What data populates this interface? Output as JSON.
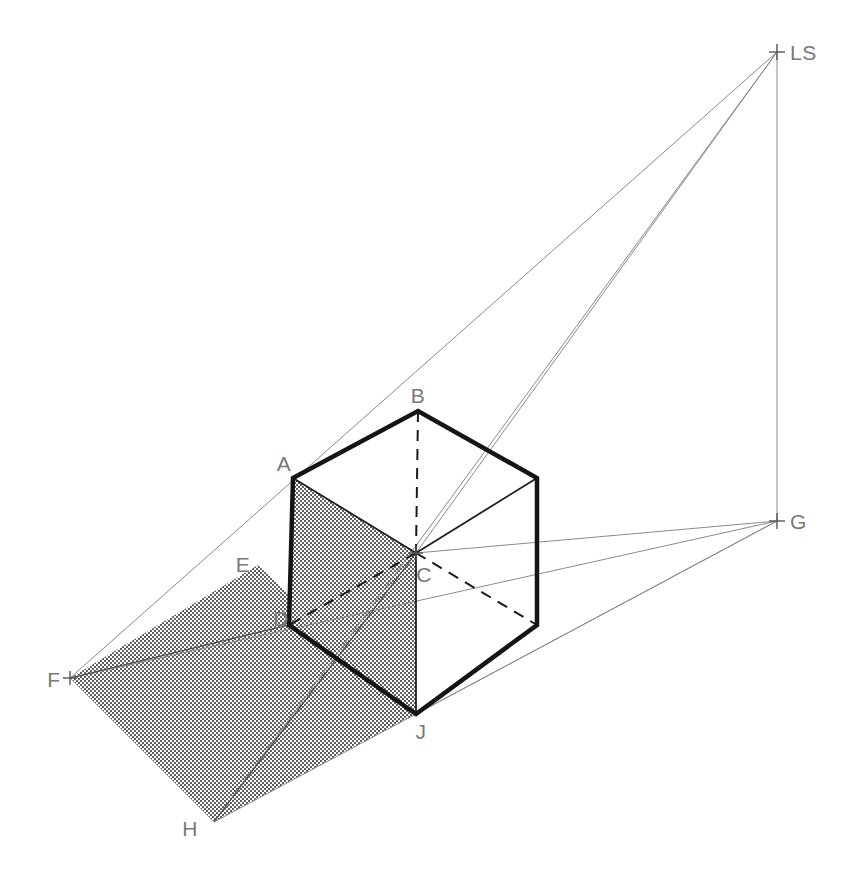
{
  "document": {
    "title": "Shadow Projection Construction",
    "type": "technical-line-drawing",
    "background_color": "#ffffff",
    "width": 856,
    "height": 888
  },
  "palette": {
    "solid_edge": "#1a1a1a",
    "thin_edge": "#333333",
    "ray_line": "#8a8a8a",
    "hidden_edge": "#1a1a1a",
    "label_text": "#77787b",
    "shadow_fill": "#c9c9c9",
    "shadow_dot": "#6e6e6e"
  },
  "labels": [
    {
      "id": "LS",
      "text": "LS",
      "x": 790,
      "y": 60,
      "anchor": "start"
    },
    {
      "id": "G",
      "text": "G",
      "x": 790,
      "y": 529,
      "anchor": "start"
    },
    {
      "id": "B",
      "text": "B",
      "x": 418,
      "y": 403,
      "anchor": "middle"
    },
    {
      "id": "A",
      "text": "A",
      "x": 284,
      "y": 471,
      "anchor": "middle"
    },
    {
      "id": "E",
      "text": "E",
      "x": 243,
      "y": 572,
      "anchor": "middle"
    },
    {
      "id": "C",
      "text": "C",
      "x": 424,
      "y": 582,
      "anchor": "middle"
    },
    {
      "id": "D",
      "text": "D",
      "x": 281,
      "y": 626,
      "anchor": "middle"
    },
    {
      "id": "F",
      "text": "F",
      "x": 54,
      "y": 687,
      "anchor": "middle"
    },
    {
      "id": "J",
      "text": "J",
      "x": 421,
      "y": 739,
      "anchor": "middle"
    },
    {
      "id": "H",
      "text": "H",
      "x": 190,
      "y": 836,
      "anchor": "middle"
    }
  ],
  "points": {
    "LS": {
      "x": 777,
      "y": 52,
      "marker": "cross"
    },
    "G": {
      "x": 777,
      "y": 521,
      "marker": "cross"
    },
    "A": {
      "x": 293,
      "y": 478,
      "marker": "none"
    },
    "B": {
      "x": 418,
      "y": 411,
      "marker": "none"
    },
    "C": {
      "x": 416,
      "y": 553,
      "marker": "cross"
    },
    "D": {
      "x": 289,
      "y": 625,
      "marker": "none"
    },
    "E": {
      "x": 258,
      "y": 565,
      "marker": "none"
    },
    "F": {
      "x": 70,
      "y": 678,
      "marker": "cross"
    },
    "H": {
      "x": 214,
      "y": 822,
      "marker": "none"
    },
    "J": {
      "x": 416,
      "y": 714,
      "marker": "none"
    },
    "TR": {
      "x": 537,
      "y": 478,
      "marker": "none"
    },
    "BR": {
      "x": 537,
      "y": 625,
      "marker": "none"
    },
    "JR": {
      "x": 537,
      "y": 625,
      "marker": "none"
    }
  },
  "geometry": {
    "cube_outline_bold": "M 293 478 L 418 411 L 537 478 L 537 625 L 416 714 L 289 625 Z",
    "cube_thin_edges": [
      {
        "name": "edge-A-C",
        "d": "M 293 478 L 416 553"
      },
      {
        "name": "edge-C-TR",
        "d": "M 416 553 L 537 478"
      },
      {
        "name": "edge-C-J",
        "d": "M 416 553 L 416 714"
      },
      {
        "name": "edge-J-BR",
        "d": "M 416 714 L 537 625"
      }
    ],
    "hidden_edges": [
      {
        "name": "hidden-B-C",
        "d": "M 418 411 L 416 553"
      },
      {
        "name": "hidden-C-D",
        "d": "M 416 553 L 289 625"
      },
      {
        "name": "hidden-C-BR",
        "d": "M 416 553 L 537 625"
      }
    ],
    "shadow_polygon": "M 258 565 L 70 678 L 214 822 L 416 714 Z",
    "shadow_face_left": "M 293 478 L 416 553 L 416 714 L 289 625 Z",
    "shadow_lines": [
      {
        "name": "shadow-line-F-D",
        "d": "M 70 678 L 289 625"
      },
      {
        "name": "shadow-line-D-J-back",
        "d": "M 289 625 L 416 714"
      },
      {
        "name": "shadow-line-H-C",
        "d": "M 214 822 L 416 553"
      }
    ],
    "light_rays": [
      {
        "name": "ray-LS-to-F-through-A",
        "d": "M 777 52 L 70 678"
      },
      {
        "name": "ray-LS-to-B-through-H",
        "d": "M 777 52 L 214 822"
      },
      {
        "name": "ray-LS-to-C",
        "d": "M 777 52 L 416 553"
      },
      {
        "name": "ray-LS-to-G-vertical",
        "d": "M 777 52 L 777 521"
      },
      {
        "name": "ray-G-to-E-through-F",
        "d": "M 777 521 L 70 678"
      },
      {
        "name": "ray-G-to-C",
        "d": "M 777 521 L 416 553"
      },
      {
        "name": "ray-G-to-J",
        "d": "M 777 521 L 416 714"
      },
      {
        "name": "ray-G-to-H",
        "d": "M 777 521 L 214 822"
      }
    ]
  },
  "legend": {
    "light_source": "LS",
    "ground_vanishing_point": "G",
    "cube_vertices": [
      "A",
      "B",
      "C",
      "D",
      "J"
    ],
    "shadow_vertices": [
      "E",
      "F",
      "H",
      "J"
    ]
  }
}
